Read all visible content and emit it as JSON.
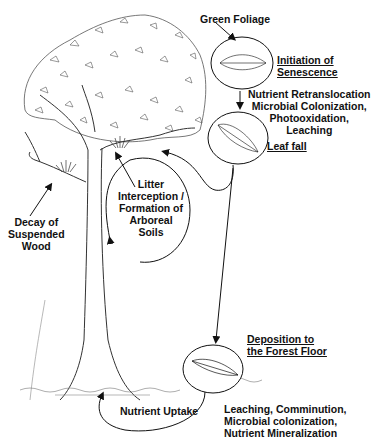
{
  "diagram": {
    "type": "nutrient-cycling-illustration",
    "stages": [
      {
        "id": "green-foliage",
        "label": "Green Foliage"
      },
      {
        "id": "initiation",
        "label_line1": "Initiation of",
        "label_line2": "Senescence",
        "underlined": true
      },
      {
        "id": "processes-canopy",
        "lines": [
          "Nutrient Retranslocation",
          "Microbial Colonization,",
          "Photooxidation,",
          "Leaching"
        ]
      },
      {
        "id": "leaf-fall",
        "label": "Leaf fall",
        "underlined": true
      },
      {
        "id": "litter-interception",
        "lines": [
          "Litter",
          "Interception /",
          "Formation of",
          "Arboreal",
          "Soils"
        ]
      },
      {
        "id": "decay-wood",
        "lines": [
          "Decay of",
          "Suspended",
          "Wood"
        ]
      },
      {
        "id": "deposition",
        "label_line1": "Deposition to",
        "label_line2": "the Forest Floor",
        "underlined": true
      },
      {
        "id": "processes-floor",
        "lines": [
          "Leaching, Comminution,",
          "Microbial colonization,",
          "Nutrient Mineralization"
        ]
      },
      {
        "id": "nutrient-uptake",
        "label": "Nutrient Uptake"
      }
    ],
    "colors": {
      "ink": "#111111",
      "sketch": "#555555",
      "background": "#ffffff"
    }
  }
}
